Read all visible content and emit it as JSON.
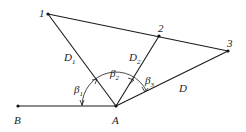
{
  "diagram": {
    "points": {
      "B": {
        "label": "B"
      },
      "A": {
        "label": "A"
      },
      "1": {
        "label": "1"
      },
      "2": {
        "label": "2"
      },
      "3": {
        "label": "3"
      }
    },
    "segments": [
      {
        "from": "B",
        "to": "A"
      },
      {
        "from": "A",
        "to": "1",
        "label": "D",
        "sub": "1"
      },
      {
        "from": "A",
        "to": "2",
        "label": "D",
        "sub": "2"
      },
      {
        "from": "A",
        "to": "3",
        "label": "D",
        "sub": ""
      },
      {
        "from": "1",
        "to": "3"
      }
    ],
    "angles": [
      {
        "symbol": "β",
        "sub": "1"
      },
      {
        "symbol": "β",
        "sub": "2"
      },
      {
        "symbol": "β",
        "sub": "3"
      }
    ]
  }
}
